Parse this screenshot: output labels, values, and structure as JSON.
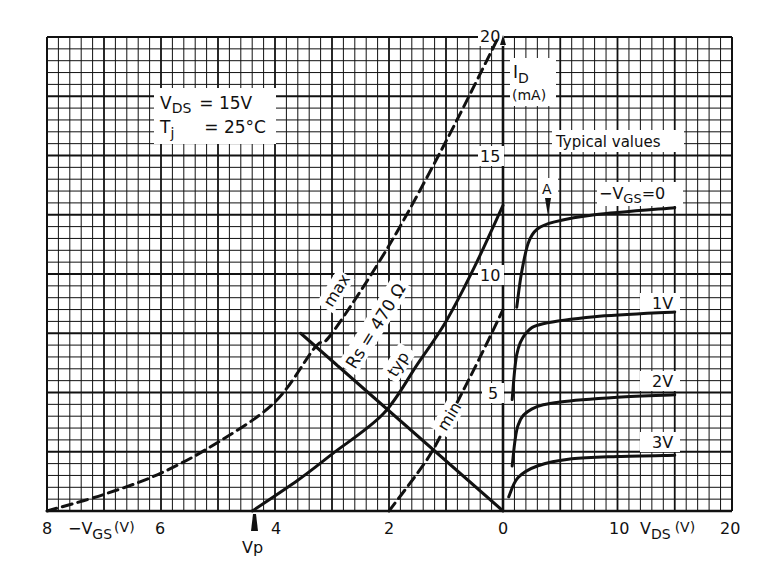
{
  "chart_data": {
    "type": "line",
    "conditions": [
      "VDS = 15V",
      "Tj = 25°C"
    ],
    "note": "Typical values",
    "y_axis": {
      "label": "ID",
      "unit": "(mA)",
      "range": [
        0,
        20
      ],
      "ticks": [
        5,
        10,
        15,
        20
      ]
    },
    "left_x_axis": {
      "label": "-VGS (V)",
      "range": [
        8,
        0
      ],
      "ticks": [
        8,
        6,
        4,
        2,
        0
      ]
    },
    "right_x_axis": {
      "label": "VDS (V)",
      "range": [
        0,
        20
      ],
      "ticks": [
        0,
        10,
        20
      ]
    },
    "grid": true,
    "annotations": [
      {
        "text": "Vp",
        "position": {
          "-VGS": 4.4,
          "ID": 0
        },
        "marker": "arrow-up"
      },
      {
        "text": "A",
        "position": {
          "VDS": 4.0,
          "ID": 12.2
        },
        "marker": "arrow-down"
      },
      {
        "text": "Rs = 470 Ω",
        "type": "load-line"
      }
    ],
    "transfer_series": [
      {
        "name": "max",
        "style": "dashed",
        "points": [
          [
            8.0,
            0.0
          ],
          [
            7.0,
            0.7
          ],
          [
            6.0,
            1.6
          ],
          [
            5.0,
            2.9
          ],
          [
            4.0,
            4.6
          ],
          [
            3.3,
            6.9
          ],
          [
            3.0,
            7.5
          ],
          [
            2.0,
            11.2
          ],
          [
            1.0,
            15.6
          ],
          [
            0.1,
            19.9
          ]
        ]
      },
      {
        "name": "typ",
        "style": "solid",
        "points": [
          [
            4.4,
            0.0
          ],
          [
            3.6,
            1.3
          ],
          [
            3.0,
            2.4
          ],
          [
            2.1,
            4.1
          ],
          [
            1.5,
            6.2
          ],
          [
            1.0,
            8.0
          ],
          [
            0.5,
            10.3
          ],
          [
            0.0,
            12.9
          ]
        ]
      },
      {
        "name": "min",
        "style": "dashed",
        "points": [
          [
            2.0,
            0.0
          ],
          [
            1.5,
            1.6
          ],
          [
            1.2,
            2.7
          ],
          [
            0.8,
            4.6
          ],
          [
            0.4,
            6.5
          ],
          [
            0.0,
            8.5
          ]
        ]
      },
      {
        "name": "Rs = 470 Ω",
        "style": "solid",
        "points": [
          [
            3.55,
            7.5
          ],
          [
            0.0,
            0.0
          ]
        ]
      }
    ],
    "output_series": [
      {
        "name": "-VGS=0",
        "style": "solid",
        "points": [
          [
            1.2,
            8.6
          ],
          [
            1.6,
            10.0
          ],
          [
            2.2,
            11.3
          ],
          [
            3.0,
            11.9
          ],
          [
            4.5,
            12.2
          ],
          [
            8.0,
            12.5
          ],
          [
            15.0,
            12.8
          ]
        ]
      },
      {
        "name": "1V",
        "style": "solid",
        "points": [
          [
            0.8,
            4.7
          ],
          [
            1.2,
            6.6
          ],
          [
            2.0,
            7.5
          ],
          [
            3.5,
            7.9
          ],
          [
            8.0,
            8.2
          ],
          [
            15.0,
            8.4
          ]
        ]
      },
      {
        "name": "2V",
        "style": "solid",
        "points": [
          [
            0.8,
            1.9
          ],
          [
            1.3,
            3.6
          ],
          [
            2.5,
            4.3
          ],
          [
            5.0,
            4.6
          ],
          [
            10.0,
            4.8
          ],
          [
            15.0,
            4.9
          ]
        ]
      },
      {
        "name": "3V",
        "style": "solid",
        "points": [
          [
            0.5,
            0.6
          ],
          [
            1.3,
            1.4
          ],
          [
            3.0,
            1.9
          ],
          [
            6.0,
            2.2
          ],
          [
            10.0,
            2.3
          ],
          [
            15.0,
            2.35
          ]
        ]
      }
    ]
  },
  "labels": {
    "vds_cond_main": "V",
    "vds_cond_sub": "DS",
    "vds_cond_val": "=  15V",
    "tj_main": "T",
    "tj_sub": "j",
    "tj_val": "=  25°C",
    "id_main": "I",
    "id_sub": "D",
    "id_unit": "(mA)",
    "typical": "Typical values",
    "vgs0_main": "−V",
    "vgs0_sub": "GS",
    "vgs0_val": "=0",
    "v1": "1V",
    "v2": "2V",
    "v3": "3V",
    "a_marker": "A",
    "max": "max",
    "typ": "typ",
    "min": "min",
    "rs": "Rs = 470 Ω",
    "vp": "Vp",
    "y20": "20",
    "y15": "15",
    "y10": "10",
    "y5": "5",
    "x8": "8",
    "x6": "6",
    "x4": "4",
    "x2": "2",
    "x0": "0",
    "x10": "10",
    "x20": "20",
    "vgs_axis_main": "−V",
    "vgs_axis_sub": "GS",
    "vgs_axis_unit": "(V)",
    "vds_axis_main": "V",
    "vds_axis_sub": "DS",
    "vds_axis_unit": "(V)"
  }
}
